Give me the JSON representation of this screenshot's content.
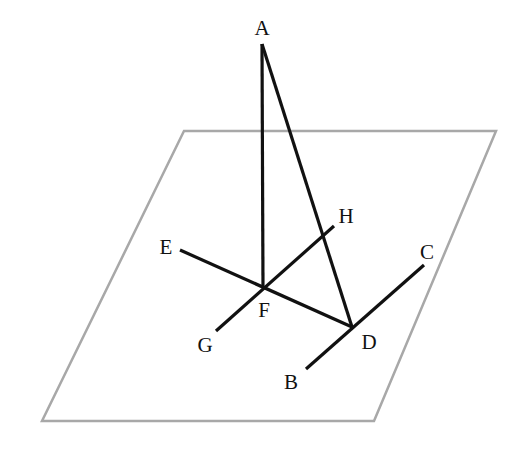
{
  "diagram": {
    "type": "3D geometry figure: perpendicular line to a plane",
    "plane": {
      "color": "#a8a8a8",
      "corners": [
        [
          184,
          131
        ],
        [
          496,
          131
        ],
        [
          374,
          421
        ],
        [
          42,
          421
        ]
      ]
    },
    "line_color": "#111111",
    "points": {
      "A": {
        "label": "A",
        "x": 262,
        "y": 44,
        "lx": 262,
        "ly": 35
      },
      "E": {
        "label": "E",
        "x": 180,
        "y": 250,
        "lx": 166,
        "ly": 254
      },
      "F": {
        "label": "F",
        "x": 263,
        "y": 287,
        "lx": 264,
        "ly": 317
      },
      "G": {
        "label": "G",
        "x": 216,
        "y": 331,
        "lx": 205,
        "ly": 352
      },
      "H": {
        "label": "H",
        "x": 334,
        "y": 226,
        "lx": 346,
        "ly": 223
      },
      "C": {
        "label": "C",
        "x": 424,
        "y": 265,
        "lx": 427,
        "ly": 259
      },
      "D": {
        "label": "D",
        "x": 352,
        "y": 327,
        "lx": 369,
        "ly": 349
      },
      "B": {
        "label": "B",
        "x": 306,
        "y": 369,
        "lx": 291,
        "ly": 389
      }
    },
    "segments": [
      [
        "A",
        "F"
      ],
      [
        "A",
        "D"
      ],
      [
        "E",
        "D"
      ],
      [
        "G",
        "H"
      ],
      [
        "B",
        "C"
      ]
    ]
  }
}
